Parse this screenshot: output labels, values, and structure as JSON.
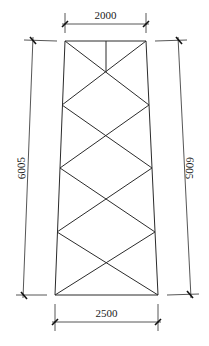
{
  "drawing": {
    "title": "Trapezoidal truss elevation with X-bracing",
    "dimensions": {
      "top_width": "2000",
      "bottom_width": "2500",
      "left_height": "6005",
      "right_height": "6005"
    },
    "units": "mm",
    "panels": 4,
    "bracing": "X-bracing (diamond pattern)",
    "colors": {
      "line": "#2b2b2b",
      "background": "#ffffff"
    }
  }
}
